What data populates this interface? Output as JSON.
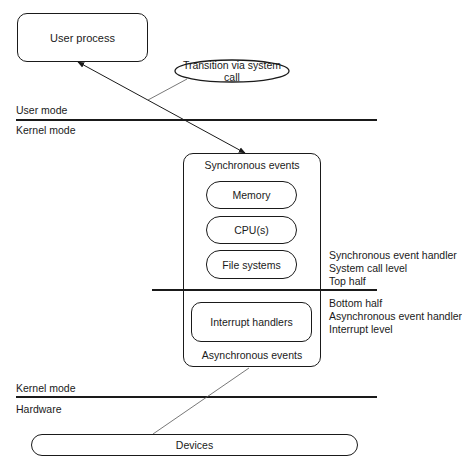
{
  "diagram": {
    "user_process": "User process",
    "transition": "Transition via system call",
    "boundaries": {
      "user_mode": "User mode",
      "kernel_mode_top": "Kernel mode",
      "kernel_mode_bottom": "Kernel mode",
      "hardware": "Hardware"
    },
    "kernel": {
      "synchronous_events": "Synchronous events",
      "resources": [
        "Memory",
        "CPU(s)",
        "File systems"
      ],
      "interrupt_handlers": "Interrupt handlers",
      "asynchronous_events": "Asynchronous events"
    },
    "top_half_labels": [
      "Synchronous event handler",
      "System call level",
      "Top half"
    ],
    "bottom_half_labels": [
      "Bottom half",
      "Asynchronous event handler",
      "Interrupt level"
    ],
    "devices": "Devices"
  }
}
